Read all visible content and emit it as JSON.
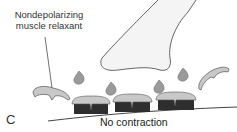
{
  "figure": {
    "panel_letter": "C",
    "drug_label_line1": "Nondepolarizing",
    "drug_label_line2": "muscle relaxant",
    "result_label": "No contraction"
  },
  "colors": {
    "outline": "#555555",
    "nerve_fill": "#f4f4f4",
    "drop_fill": "#9a9a9a",
    "blocker_fill": "#c8c8c8",
    "receptor_dark": "#2e2e2e"
  }
}
